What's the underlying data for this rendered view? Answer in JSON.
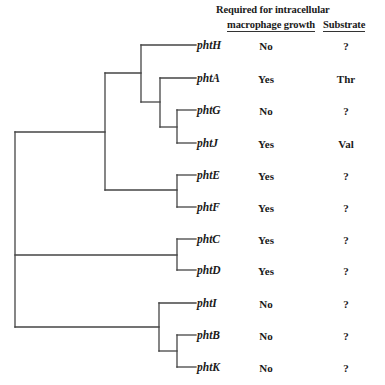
{
  "header": {
    "req_line1": "Required for intracellular",
    "req_line2": "macrophage growth",
    "substrate": "Substrate"
  },
  "genes": [
    {
      "name": "phtH",
      "required": "No",
      "substrate": "?"
    },
    {
      "name": "phtA",
      "required": "Yes",
      "substrate": "Thr"
    },
    {
      "name": "phtG",
      "required": "No",
      "substrate": "?"
    },
    {
      "name": "phtJ",
      "required": "Yes",
      "substrate": "Val"
    },
    {
      "name": "phtE",
      "required": "Yes",
      "substrate": "?"
    },
    {
      "name": "phtF",
      "required": "Yes",
      "substrate": "?"
    },
    {
      "name": "phtC",
      "required": "Yes",
      "substrate": "?"
    },
    {
      "name": "phtD",
      "required": "Yes",
      "substrate": "?"
    },
    {
      "name": "phtI",
      "required": "No",
      "substrate": "?"
    },
    {
      "name": "phtB",
      "required": "No",
      "substrate": "?"
    },
    {
      "name": "phtK",
      "required": "No",
      "substrate": "?"
    }
  ],
  "tree": {
    "topology": "((((phtH,(phtA,(phtG,phtJ))),(phtE,phtF)),(phtC,phtD)),(phtI,(phtB,phtK)))",
    "line_color": "#444444"
  }
}
